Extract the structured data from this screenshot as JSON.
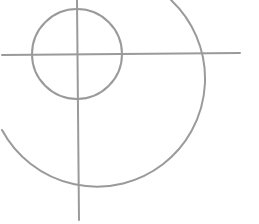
{
  "diagram": {
    "type": "crosshair-target",
    "stroke_color": "#9a9a9a",
    "stroke_width": 2,
    "background": "#ffffff",
    "small_circle": {
      "cx": 77,
      "cy": 54,
      "r": 45
    },
    "large_arc": {
      "cx": 78,
      "cy": 54,
      "r": 108,
      "start": [
        171,
        0
      ],
      "end": [
        2,
        130
      ]
    },
    "horizontal_line": {
      "x1": 2,
      "y1": 55,
      "x2": 240,
      "y2": 53
    },
    "vertical_line": {
      "x1": 77,
      "y1": 0,
      "x2": 79,
      "y2": 220
    }
  }
}
